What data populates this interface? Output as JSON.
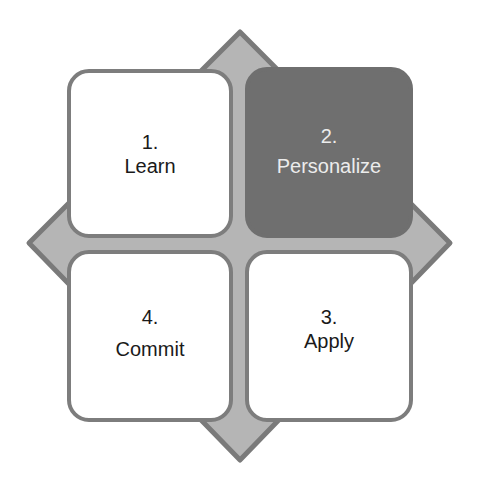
{
  "diagram": {
    "type": "four-step cycle matrix",
    "colors": {
      "diamond_fill": "#b5b5b5",
      "diamond_stroke": "#7a7a7a",
      "box_light": "#ffffff",
      "box_dark": "#6f6f6f",
      "box_border": "#7d7d7d",
      "text_dark": "#1a1a1a",
      "text_light": "#ececec"
    },
    "steps": [
      {
        "number": "1.",
        "label": "Learn",
        "position": "top-left",
        "highlighted": false
      },
      {
        "number": "2.",
        "label": "Personalize",
        "position": "top-right",
        "highlighted": true
      },
      {
        "number": "3.",
        "label": "Apply",
        "position": "bottom-right",
        "highlighted": false
      },
      {
        "number": "4.",
        "label": "Commit",
        "position": "bottom-left",
        "highlighted": false
      }
    ]
  }
}
